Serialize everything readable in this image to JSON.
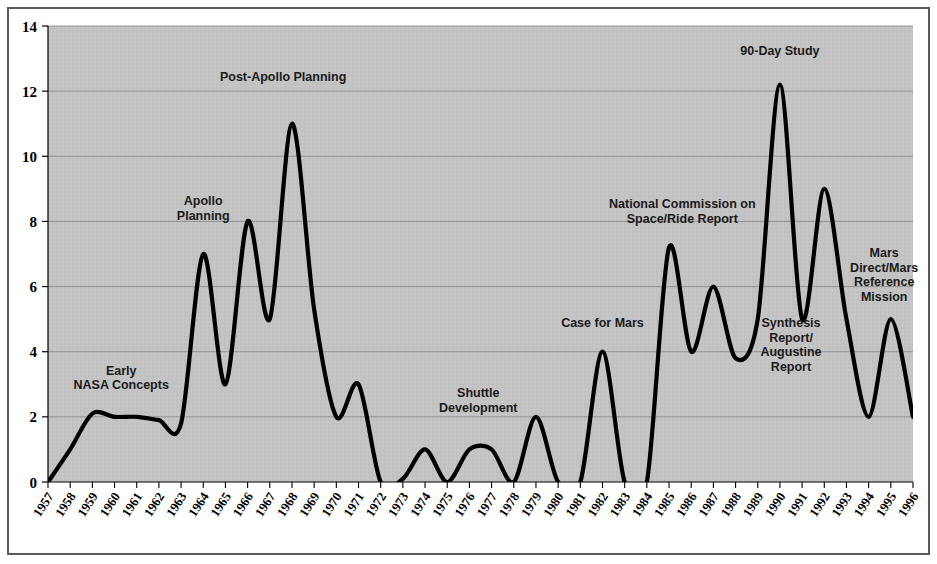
{
  "chart_data": {
    "type": "line",
    "title": "",
    "xlabel": "",
    "ylabel": "",
    "xlim": [
      1957,
      1996
    ],
    "ylim": [
      0,
      14
    ],
    "ytick_step": 2,
    "grid": true,
    "legend": "none",
    "plot_background": "#c3c3c3",
    "line_color": "#000000",
    "gridline_color": "#8c8c8c",
    "axis_color": "#000000",
    "categories": [
      "1957",
      "1958",
      "1959",
      "1960",
      "1961",
      "1962",
      "1963",
      "1964",
      "1965",
      "1966",
      "1967",
      "1968",
      "1969",
      "1970",
      "1971",
      "1972",
      "1973",
      "1974",
      "1975",
      "1976",
      "1977",
      "1978",
      "1979",
      "1980",
      "1981",
      "1982",
      "1983",
      "1984",
      "1985",
      "1986",
      "1987",
      "1988",
      "1989",
      "1990",
      "1991",
      "1992",
      "1993",
      "1994",
      "1995",
      "1996"
    ],
    "ytick_labels": [
      "0",
      "2",
      "4",
      "6",
      "8",
      "10",
      "12",
      "14"
    ],
    "ytick_values": [
      0,
      2,
      4,
      6,
      8,
      10,
      12,
      14
    ],
    "series": [
      {
        "name": "Mars mission study activity",
        "values": [
          0,
          1.0,
          2.1,
          2.0,
          2.0,
          1.9,
          1.8,
          7.0,
          3.0,
          8.0,
          5.0,
          11.0,
          5.3,
          2.0,
          3.0,
          0.0,
          0.1,
          1.0,
          0.0,
          1.0,
          1.0,
          0.0,
          2.0,
          0.0,
          0.0,
          4.0,
          0.0,
          0.0,
          7.2,
          4.0,
          6.0,
          3.8,
          5.0,
          12.2,
          5.0,
          9.0,
          5.0,
          2.0,
          5.0,
          2.0
        ]
      }
    ],
    "annotations": [
      {
        "id": "early-nasa-concepts",
        "lines": [
          "Early",
          "NASA Concepts"
        ],
        "x": 1960.3,
        "y": 3.3,
        "align": "middle"
      },
      {
        "id": "apollo-planning",
        "lines": [
          "Apollo",
          "Planning"
        ],
        "x": 1964.0,
        "y": 8.5,
        "align": "middle"
      },
      {
        "id": "post-apollo-planning",
        "lines": [
          "Post-Apollo Planning"
        ],
        "x": 1967.6,
        "y": 12.3,
        "align": "middle"
      },
      {
        "id": "shuttle-development",
        "lines": [
          "Shuttle",
          "Development"
        ],
        "x": 1976.4,
        "y": 2.6,
        "align": "middle"
      },
      {
        "id": "case-for-mars",
        "lines": [
          "Case for Mars"
        ],
        "x": 1982.0,
        "y": 4.75,
        "align": "middle"
      },
      {
        "id": "national-commission-on-space-ride-report",
        "lines": [
          "National Commission on",
          "Space/Ride Report"
        ],
        "x": 1985.6,
        "y": 8.4,
        "align": "middle"
      },
      {
        "id": "ninety-day-study",
        "lines": [
          "90-Day Study"
        ],
        "x": 1990.0,
        "y": 13.1,
        "align": "middle"
      },
      {
        "id": "synthesis-report-augustine-report",
        "lines": [
          "Synthesis",
          "Report/",
          "Augustine",
          "Report"
        ],
        "x": 1990.5,
        "y": 4.75,
        "align": "middle"
      },
      {
        "id": "mars-direct-mars-reference-mission",
        "lines": [
          "Mars",
          "Direct/Mars",
          "Reference",
          "Mission"
        ],
        "x": 1994.7,
        "y": 6.9,
        "align": "middle"
      }
    ]
  }
}
